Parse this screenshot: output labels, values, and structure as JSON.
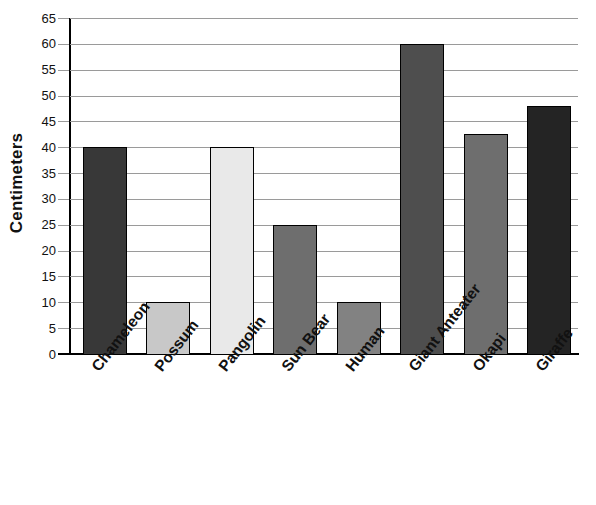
{
  "chart_data": {
    "type": "bar",
    "title": "",
    "xlabel": "",
    "ylabel": "Centimeters",
    "ylim": [
      0,
      65
    ],
    "yticks": [
      0,
      5,
      10,
      15,
      20,
      25,
      30,
      35,
      40,
      45,
      50,
      55,
      60,
      65
    ],
    "grid": true,
    "legend": null,
    "categories": [
      "Chameleon",
      "Possum",
      "Pangolin",
      "Sun Bear",
      "Human",
      "Giant Anteater",
      "Okapi",
      "Giraffe"
    ],
    "values": [
      40,
      10,
      40,
      25,
      10,
      60,
      42.5,
      48
    ],
    "bar_colors": [
      "#383838",
      "#c8c8c8",
      "#e9e9e9",
      "#6e6e6e",
      "#828282",
      "#4e4e4e",
      "#6e6e6e",
      "#242424"
    ],
    "bar_edge_color": "#000000",
    "gridline_color": "#9a9a9a",
    "axis_color": "#000000",
    "background_color": "#ffffff"
  }
}
